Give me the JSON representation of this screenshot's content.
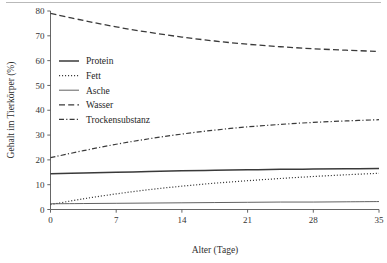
{
  "figure": {
    "background_color": "#ffffff",
    "line_color": "#3a3a3a",
    "axis_color": "#555555"
  },
  "chart_data": {
    "type": "line",
    "title": "",
    "xlabel": "Alter (Tage)",
    "ylabel": "Gehalt im Tierkörper (%)",
    "xlim": [
      0,
      35
    ],
    "ylim": [
      0,
      80
    ],
    "xticks": [
      0,
      7,
      14,
      21,
      28,
      35
    ],
    "yticks": [
      0,
      10,
      20,
      30,
      40,
      50,
      60,
      70,
      80
    ],
    "xticklabels": [
      "0",
      "7",
      "14",
      "21",
      "28",
      "35"
    ],
    "yticklabels": [
      "0",
      "10",
      "20",
      "30",
      "40",
      "50",
      "60",
      "70",
      "80"
    ],
    "grid": false,
    "legend_position": "upper left",
    "x": [
      0,
      3.5,
      7,
      10.5,
      14,
      17.5,
      21,
      24.5,
      28,
      31.5,
      35
    ],
    "series": [
      {
        "name": "Protein",
        "linestyle": "solid",
        "linewidth": 1.5,
        "values": [
          14.4,
          14.7,
          15.0,
          15.3,
          15.6,
          15.8,
          16.0,
          16.2,
          16.3,
          16.4,
          16.5
        ]
      },
      {
        "name": "Fett",
        "linestyle": "dotted",
        "linewidth": 1.2,
        "values": [
          2.0,
          4.3,
          6.3,
          8.0,
          9.4,
          10.6,
          11.6,
          12.5,
          13.3,
          14.0,
          14.6
        ]
      },
      {
        "name": "Asche",
        "linestyle": "solid-thin",
        "linewidth": 0.8,
        "values": [
          2.3,
          2.4,
          2.5,
          2.6,
          2.7,
          2.8,
          2.9,
          3.0,
          3.0,
          3.1,
          3.2
        ]
      },
      {
        "name": "Wasser",
        "linestyle": "dashed",
        "linewidth": 1.3,
        "values": [
          79.0,
          76.2,
          73.6,
          71.4,
          69.5,
          67.9,
          66.6,
          65.6,
          64.8,
          64.2,
          63.7
        ]
      },
      {
        "name": "Trockensubstanz",
        "linestyle": "dashdot",
        "linewidth": 1.2,
        "values": [
          20.9,
          23.7,
          26.3,
          28.5,
          30.4,
          32.0,
          33.3,
          34.3,
          35.1,
          35.7,
          36.2
        ]
      }
    ]
  },
  "legend": {
    "items": [
      {
        "label": "Protein"
      },
      {
        "label": "Fett"
      },
      {
        "label": "Asche"
      },
      {
        "label": "Wasser"
      },
      {
        "label": "Trockensubstanz"
      }
    ]
  }
}
